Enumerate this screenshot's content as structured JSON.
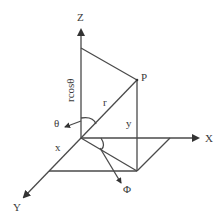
{
  "diagram": {
    "type": "spherical-coordinate-system",
    "axes": {
      "z": "Z",
      "x": "X",
      "y": "Y"
    },
    "point": "P",
    "labels": {
      "rcos": "rcosθ",
      "r": "r",
      "theta": "θ",
      "phi": "Φ",
      "x": "x",
      "y": "y"
    },
    "colors": {
      "line": "#4a4a4a",
      "text": "#3a3a3a",
      "background": "#ffffff"
    }
  }
}
